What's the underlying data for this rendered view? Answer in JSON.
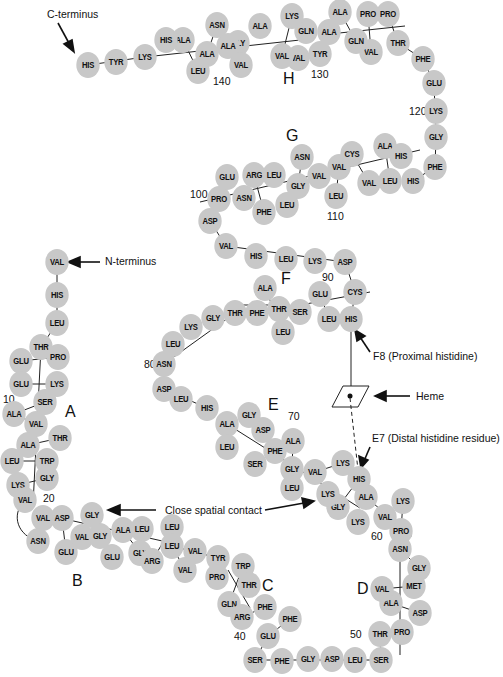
{
  "annotations": {
    "c_terminus": "C-terminus",
    "n_terminus": "N-terminus",
    "f8": "F8 (Proximal histidine)",
    "heme": "Heme",
    "e7": "E7 (Distal histidine residue)",
    "contact": "Close spatial contact"
  },
  "helices": [
    "A",
    "B",
    "C",
    "D",
    "E",
    "F",
    "G",
    "H"
  ],
  "numbers": [
    "10",
    "20",
    "40",
    "50",
    "60",
    "70",
    "80",
    "90",
    "100",
    "110",
    "120",
    "130",
    "140"
  ],
  "residues": [
    {
      "n": "VAL",
      "x": 57,
      "y": 262
    },
    {
      "n": "HIS",
      "x": 57,
      "y": 295
    },
    {
      "n": "LEU",
      "x": 57,
      "y": 323
    },
    {
      "n": "THR",
      "x": 41,
      "y": 347
    },
    {
      "n": "PRO",
      "x": 58,
      "y": 357
    },
    {
      "n": "GLU",
      "x": 21,
      "y": 361
    },
    {
      "n": "GLU",
      "x": 21,
      "y": 384
    },
    {
      "n": "LYS",
      "x": 57,
      "y": 384
    },
    {
      "n": "SER",
      "x": 45,
      "y": 402
    },
    {
      "n": "ALA",
      "x": 14,
      "y": 414
    },
    {
      "n": "VAL",
      "x": 36,
      "y": 424
    },
    {
      "n": "THR",
      "x": 60,
      "y": 438
    },
    {
      "n": "ALA",
      "x": 28,
      "y": 445
    },
    {
      "n": "LEU",
      "x": 12,
      "y": 461
    },
    {
      "n": "TRP",
      "x": 47,
      "y": 461
    },
    {
      "n": "GLY",
      "x": 47,
      "y": 478
    },
    {
      "n": "LYS",
      "x": 18,
      "y": 485
    },
    {
      "n": "VAL",
      "x": 25,
      "y": 500
    },
    {
      "n": "VAL",
      "x": 43,
      "y": 518
    },
    {
      "n": "ASP",
      "x": 62,
      "y": 518
    },
    {
      "n": "ASN",
      "x": 38,
      "y": 541
    },
    {
      "n": "GLU",
      "x": 66,
      "y": 552
    },
    {
      "n": "VAL",
      "x": 82,
      "y": 537
    },
    {
      "n": "GLY",
      "x": 92,
      "y": 515
    },
    {
      "n": "GLY",
      "x": 100,
      "y": 536
    },
    {
      "n": "ALA",
      "x": 123,
      "y": 530
    },
    {
      "n": "LEU",
      "x": 142,
      "y": 529
    },
    {
      "n": "GLU",
      "x": 112,
      "y": 557
    },
    {
      "n": "GLY",
      "x": 140,
      "y": 553
    },
    {
      "n": "ARG",
      "x": 152,
      "y": 561
    },
    {
      "n": "LEU",
      "x": 172,
      "y": 527
    },
    {
      "n": "LEU",
      "x": 172,
      "y": 546
    },
    {
      "n": "VAL",
      "x": 195,
      "y": 551
    },
    {
      "n": "VAL",
      "x": 185,
      "y": 570
    },
    {
      "n": "TYR",
      "x": 218,
      "y": 558
    },
    {
      "n": "PRO",
      "x": 217,
      "y": 577
    },
    {
      "n": "TRP",
      "x": 243,
      "y": 566
    },
    {
      "n": "THR",
      "x": 249,
      "y": 585
    },
    {
      "n": "GLN",
      "x": 229,
      "y": 604
    },
    {
      "n": "ARG",
      "x": 242,
      "y": 617
    },
    {
      "n": "PHE",
      "x": 265,
      "y": 607
    },
    {
      "n": "PHE",
      "x": 290,
      "y": 619
    },
    {
      "n": "GLU",
      "x": 268,
      "y": 636
    },
    {
      "n": "SER",
      "x": 255,
      "y": 660
    },
    {
      "n": "PHE",
      "x": 282,
      "y": 661
    },
    {
      "n": "GLY",
      "x": 308,
      "y": 659
    },
    {
      "n": "ASP",
      "x": 332,
      "y": 659
    },
    {
      "n": "LEU",
      "x": 355,
      "y": 660
    },
    {
      "n": "SER",
      "x": 381,
      "y": 660
    },
    {
      "n": "THR",
      "x": 380,
      "y": 634
    },
    {
      "n": "PRO",
      "x": 402,
      "y": 632
    },
    {
      "n": "ASP",
      "x": 420,
      "y": 613
    },
    {
      "n": "ALA",
      "x": 391,
      "y": 603
    },
    {
      "n": "VAL",
      "x": 382,
      "y": 589
    },
    {
      "n": "MET",
      "x": 414,
      "y": 586
    },
    {
      "n": "GLY",
      "x": 419,
      "y": 568
    },
    {
      "n": "ASN",
      "x": 400,
      "y": 549
    },
    {
      "n": "PRO",
      "x": 401,
      "y": 531
    },
    {
      "n": "LYS",
      "x": 403,
      "y": 501
    },
    {
      "n": "VAL",
      "x": 385,
      "y": 517
    },
    {
      "n": "LYS",
      "x": 358,
      "y": 522
    },
    {
      "n": "ALA",
      "x": 366,
      "y": 497
    },
    {
      "n": "HIS",
      "x": 359,
      "y": 479
    },
    {
      "n": "GLY",
      "x": 338,
      "y": 507
    },
    {
      "n": "LYS",
      "x": 328,
      "y": 494
    },
    {
      "n": "LYS",
      "x": 343,
      "y": 463
    },
    {
      "n": "VAL",
      "x": 315,
      "y": 472
    },
    {
      "n": "GLY",
      "x": 292,
      "y": 469
    },
    {
      "n": "LEU",
      "x": 292,
      "y": 488
    },
    {
      "n": "ALA",
      "x": 293,
      "y": 441
    },
    {
      "n": "PHE",
      "x": 275,
      "y": 451
    },
    {
      "n": "SER",
      "x": 255,
      "y": 464
    },
    {
      "n": "ASP",
      "x": 263,
      "y": 430
    },
    {
      "n": "GLY",
      "x": 249,
      "y": 415
    },
    {
      "n": "ALA",
      "x": 227,
      "y": 424
    },
    {
      "n": "LEU",
      "x": 227,
      "y": 447
    },
    {
      "n": "HIS",
      "x": 207,
      "y": 408
    },
    {
      "n": "LEU",
      "x": 181,
      "y": 399
    },
    {
      "n": "ASP",
      "x": 164,
      "y": 389
    },
    {
      "n": "ASN",
      "x": 164,
      "y": 364
    },
    {
      "n": "LEU",
      "x": 173,
      "y": 344
    },
    {
      "n": "LYS",
      "x": 191,
      "y": 327
    },
    {
      "n": "GLY",
      "x": 213,
      "y": 318
    },
    {
      "n": "THR",
      "x": 235,
      "y": 313
    },
    {
      "n": "PHE",
      "x": 257,
      "y": 313
    },
    {
      "n": "ALA",
      "x": 265,
      "y": 288
    },
    {
      "n": "THR",
      "x": 279,
      "y": 309
    },
    {
      "n": "LEU",
      "x": 283,
      "y": 332
    },
    {
      "n": "SER",
      "x": 300,
      "y": 312
    },
    {
      "n": "GLU",
      "x": 320,
      "y": 294
    },
    {
      "n": "LEU",
      "x": 329,
      "y": 319
    },
    {
      "n": "HIS",
      "x": 351,
      "y": 319
    },
    {
      "n": "CYS",
      "x": 355,
      "y": 292
    },
    {
      "n": "ASP",
      "x": 345,
      "y": 262
    },
    {
      "n": "LYS",
      "x": 315,
      "y": 261
    },
    {
      "n": "LEU",
      "x": 286,
      "y": 259
    },
    {
      "n": "HIS",
      "x": 256,
      "y": 256
    },
    {
      "n": "VAL",
      "x": 226,
      "y": 246
    },
    {
      "n": "ASP",
      "x": 210,
      "y": 221
    },
    {
      "n": "PRO",
      "x": 219,
      "y": 199
    },
    {
      "n": "ASN",
      "x": 244,
      "y": 198
    },
    {
      "n": "GLU",
      "x": 227,
      "y": 177
    },
    {
      "n": "ARG",
      "x": 254,
      "y": 175
    },
    {
      "n": "LEU",
      "x": 274,
      "y": 175
    },
    {
      "n": "PHE",
      "x": 264,
      "y": 212
    },
    {
      "n": "LEU",
      "x": 287,
      "y": 205
    },
    {
      "n": "GLY",
      "x": 298,
      "y": 186
    },
    {
      "n": "ASN",
      "x": 302,
      "y": 157
    },
    {
      "n": "VAL",
      "x": 319,
      "y": 176
    },
    {
      "n": "LEU",
      "x": 336,
      "y": 196
    },
    {
      "n": "VAL",
      "x": 339,
      "y": 167
    },
    {
      "n": "CYS",
      "x": 352,
      "y": 154
    },
    {
      "n": "VAL",
      "x": 369,
      "y": 183
    },
    {
      "n": "LEU",
      "x": 390,
      "y": 181
    },
    {
      "n": "ALA",
      "x": 385,
      "y": 146
    },
    {
      "n": "HIS",
      "x": 401,
      "y": 156
    },
    {
      "n": "HIS",
      "x": 413,
      "y": 181
    },
    {
      "n": "PHE",
      "x": 435,
      "y": 167
    },
    {
      "n": "GLY",
      "x": 436,
      "y": 137
    },
    {
      "n": "LYS",
      "x": 436,
      "y": 111
    },
    {
      "n": "GLU",
      "x": 434,
      "y": 83
    },
    {
      "n": "PHE",
      "x": 423,
      "y": 59
    },
    {
      "n": "THR",
      "x": 398,
      "y": 43
    },
    {
      "n": "PRO",
      "x": 388,
      "y": 14
    },
    {
      "n": "PRO",
      "x": 368,
      "y": 14
    },
    {
      "n": "VAL",
      "x": 371,
      "y": 52
    },
    {
      "n": "GLN",
      "x": 356,
      "y": 41
    },
    {
      "n": "ALA",
      "x": 340,
      "y": 12
    },
    {
      "n": "ALA",
      "x": 329,
      "y": 32
    },
    {
      "n": "TYR",
      "x": 320,
      "y": 54
    },
    {
      "n": "GLN",
      "x": 306,
      "y": 31
    },
    {
      "n": "LYS",
      "x": 292,
      "y": 16
    },
    {
      "n": "VAL",
      "x": 298,
      "y": 58
    },
    {
      "n": "VAL",
      "x": 282,
      "y": 56
    },
    {
      "n": "ALA",
      "x": 260,
      "y": 26
    },
    {
      "n": "GLY",
      "x": 238,
      "y": 43
    },
    {
      "n": "VAL",
      "x": 241,
      "y": 65
    },
    {
      "n": "ALA",
      "x": 228,
      "y": 46
    },
    {
      "n": "ASN",
      "x": 217,
      "y": 25
    },
    {
      "n": "ALA",
      "x": 207,
      "y": 54
    },
    {
      "n": "LEU",
      "x": 198,
      "y": 71
    },
    {
      "n": "ALA",
      "x": 183,
      "y": 40
    },
    {
      "n": "HIS",
      "x": 166,
      "y": 40
    },
    {
      "n": "LYS",
      "x": 145,
      "y": 57
    },
    {
      "n": "TYR",
      "x": 116,
      "y": 62
    },
    {
      "n": "HIS",
      "x": 88,
      "y": 65
    }
  ]
}
